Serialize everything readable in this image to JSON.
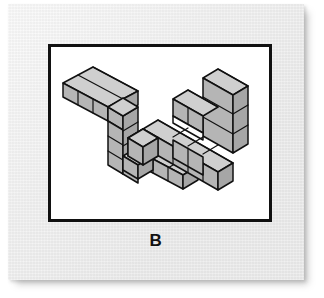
{
  "item": {
    "label": "B",
    "figure_count": 2,
    "projection": "isometric",
    "task_type": "mental-rotation"
  },
  "card": {
    "background_color": "#e9e9e9",
    "shadow_color": "#9a9a9a"
  },
  "panel": {
    "background_color": "#ffffff",
    "border_color": "#111111",
    "border_width_px": 3
  },
  "palette": {
    "outline": "#111111",
    "face_top": "#cfcfcf",
    "face_left": "#b5b5b5",
    "face_right": "#a8a8a8",
    "notch_fill": "#ffffff"
  },
  "figures": [
    {
      "name": "left-figure",
      "position": "left",
      "cube_count": 10,
      "description": "Block figure: a three-cube arm running to the upper right, a three-cube column descending, and a three-cube arm running to the lower right.",
      "segments": [
        {
          "name": "upper-arm",
          "direction": "right",
          "cubes": 3
        },
        {
          "name": "descending-column",
          "direction": "down",
          "cubes": 3
        },
        {
          "name": "lower-arm",
          "direction": "right",
          "cubes": 3
        }
      ]
    },
    {
      "name": "right-figure",
      "position": "right",
      "cube_count": 10,
      "description": "Block figure: a tall vertical stack on the right with a short arm projecting to the left and a four-cube base running to the lower left, leaving an open notch in the middle.",
      "segments": [
        {
          "name": "vertical-stack",
          "direction": "up",
          "cubes": 3
        },
        {
          "name": "upper-left-arm",
          "direction": "left",
          "cubes": 2
        },
        {
          "name": "base-row",
          "direction": "left",
          "cubes": 4
        }
      ],
      "has_open_notch": true
    }
  ]
}
